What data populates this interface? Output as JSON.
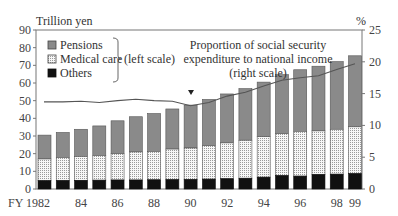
{
  "chart_data": {
    "type": "bar",
    "subtype": "stacked bar with line (dual axis)",
    "left_axis_label": "Trillion yen",
    "right_axis_label": "%",
    "xlabel_prefix": "FY",
    "categories": [
      "1982",
      "1983",
      "1984",
      "1985",
      "1986",
      "1987",
      "1988",
      "1989",
      "1990",
      "1991",
      "1992",
      "1993",
      "1994",
      "1995",
      "1996",
      "1997",
      "1998",
      "1999"
    ],
    "x_tick_labels": [
      {
        "index": 0,
        "label": "FY 1982"
      },
      {
        "index": 2,
        "label": "84"
      },
      {
        "index": 4,
        "label": "86"
      },
      {
        "index": 6,
        "label": "88"
      },
      {
        "index": 8,
        "label": "90"
      },
      {
        "index": 10,
        "label": "92"
      },
      {
        "index": 12,
        "label": "94"
      },
      {
        "index": 14,
        "label": "96"
      },
      {
        "index": 16,
        "label": "98"
      },
      {
        "index": 17,
        "label": "99"
      }
    ],
    "ylim_left": [
      0,
      90
    ],
    "yticks_left": [
      0,
      10,
      20,
      30,
      40,
      50,
      60,
      70,
      80,
      90
    ],
    "ylim_right": [
      0,
      25
    ],
    "yticks_right": [
      0,
      5,
      10,
      15,
      20,
      25
    ],
    "series": [
      {
        "name": "Others",
        "axis": "left",
        "color": "#111111",
        "pattern": "solid",
        "values": [
          4.7,
          4.8,
          4.9,
          5.0,
          5.1,
          5.1,
          5.2,
          5.3,
          5.4,
          5.6,
          5.8,
          6.1,
          6.7,
          7.6,
          7.3,
          8.2,
          8.4,
          8.7
        ]
      },
      {
        "name": "Medical care",
        "axis": "left",
        "color": "#f2f2f2",
        "pattern": "dotted",
        "values": [
          12.3,
          13.0,
          13.5,
          13.9,
          14.9,
          15.9,
          16.0,
          17.3,
          17.8,
          18.9,
          20.3,
          21.5,
          22.9,
          23.7,
          25.3,
          24.7,
          25.4,
          26.5
        ]
      },
      {
        "name": "Pensions",
        "axis": "left",
        "color": "#8a8a8a",
        "pattern": "solid",
        "values": [
          13.5,
          14.2,
          15.4,
          16.8,
          18.6,
          19.9,
          21.5,
          22.7,
          24.3,
          26.2,
          27.7,
          29.2,
          30.9,
          33.4,
          34.9,
          36.6,
          38.3,
          40.2
        ]
      },
      {
        "name": "Proportion of social security expenditure to national income",
        "axis": "right",
        "type": "line",
        "color": "#555555",
        "values": [
          13.7,
          13.7,
          13.8,
          13.6,
          13.9,
          14.1,
          13.9,
          13.8,
          13.1,
          13.6,
          14.6,
          15.2,
          16.2,
          17.1,
          17.5,
          17.8,
          18.8,
          19.7
        ]
      }
    ],
    "totals": [
      30.5,
      32.0,
      33.8,
      35.7,
      38.6,
      40.9,
      42.7,
      45.3,
      47.5,
      50.7,
      53.8,
      56.8,
      60.5,
      64.7,
      67.5,
      69.5,
      72.1,
      75.4
    ],
    "legend": {
      "entries": [
        "Pensions",
        "Medical care",
        "Others"
      ],
      "group_note": "(left scale)",
      "position": "upper-left"
    },
    "annotations": [
      {
        "text": "Proportion of social security",
        "line": 1
      },
      {
        "text": "expenditure to national income",
        "line": 2
      },
      {
        "text": "(right scale)",
        "line": 3
      },
      {
        "marker": "down-triangle",
        "at_index": 8,
        "note": "points to line"
      }
    ],
    "grid": false
  },
  "labels": {
    "left_axis": "Trillion yen",
    "right_axis": "%",
    "legend_pensions": "Pensions",
    "legend_medical": "Medical care",
    "legend_others": "Others",
    "legend_scale": "(left scale)",
    "annot_line1": "Proportion of social security",
    "annot_line2": "expenditure to national income",
    "annot_line3": "(right scale)"
  }
}
